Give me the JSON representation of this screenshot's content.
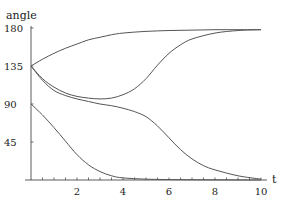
{
  "chart_data": {
    "type": "line",
    "title": "",
    "xlabel": "t",
    "ylabel": "angle",
    "xlim": [
      0,
      10
    ],
    "ylim": [
      0,
      180
    ],
    "x_ticks": [
      2,
      4,
      6,
      8,
      10
    ],
    "x_minor_step": 0.5,
    "y_ticks": [
      45,
      90,
      135,
      180
    ],
    "grid": false,
    "legend": null,
    "line_color": "#555555",
    "series": [
      {
        "name": "curve-1",
        "x": [
          0,
          0.5,
          1,
          1.5,
          2,
          2.5,
          3,
          3.5,
          4,
          5,
          6,
          7,
          8,
          9,
          10
        ],
        "values": [
          135,
          143,
          150,
          156,
          161,
          166,
          169,
          172,
          174,
          176,
          177,
          177.5,
          178,
          178,
          178
        ]
      },
      {
        "name": "curve-2",
        "x": [
          0,
          0.5,
          1,
          1.5,
          2,
          2.5,
          3,
          3.5,
          4,
          4.5,
          5,
          5.5,
          6,
          6.5,
          7,
          8,
          9,
          10
        ],
        "values": [
          135,
          120,
          110,
          103,
          99,
          97,
          96,
          97,
          101,
          108,
          120,
          136,
          150,
          160,
          167,
          174,
          177,
          178
        ]
      },
      {
        "name": "curve-3",
        "x": [
          0,
          0.5,
          1,
          1.5,
          2,
          2.5,
          3,
          3.5,
          4,
          4.5,
          5,
          5.5,
          6,
          6.5,
          7,
          7.5,
          8,
          9,
          10
        ],
        "values": [
          135,
          118,
          106,
          100,
          96,
          93,
          90,
          88,
          85,
          81,
          75,
          64,
          50,
          36,
          25,
          17,
          12,
          5,
          1
        ]
      },
      {
        "name": "curve-4",
        "x": [
          0,
          0.5,
          1,
          1.5,
          2,
          2.5,
          3,
          3.5,
          4,
          5,
          6,
          7,
          8,
          9,
          10
        ],
        "values": [
          90,
          77,
          62,
          46,
          30,
          18,
          10,
          5,
          2.5,
          1,
          0.5,
          0.3,
          0.2,
          0.1,
          0
        ]
      }
    ]
  }
}
